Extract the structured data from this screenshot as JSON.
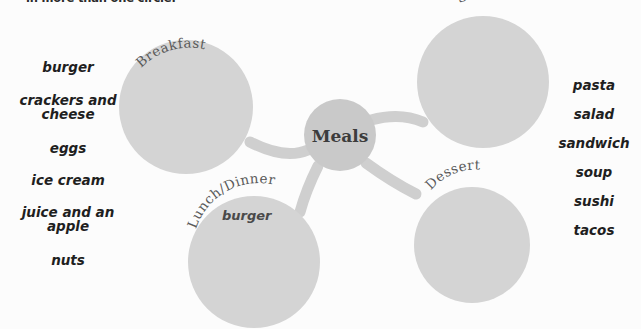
{
  "instruction": "in more than one circle.",
  "colors": {
    "background": "#fcfcfc",
    "circle_fill": "#d4d4d4",
    "center_fill": "#c9c9c9",
    "connector": "#cfcfcf",
    "label_text": "#5a5a5a",
    "word_text": "#1f1f1f"
  },
  "center_node": {
    "label": "Meals"
  },
  "nodes": [
    {
      "id": "breakfast",
      "label": "Breakfast",
      "dropped_words": []
    },
    {
      "id": "snack",
      "label": "Snack",
      "dropped_words": []
    },
    {
      "id": "lunch-dinner",
      "label": "Lunch/Dinner",
      "dropped_words": [
        "burger"
      ]
    },
    {
      "id": "dessert",
      "label": "Dessert",
      "dropped_words": []
    }
  ],
  "word_bank_left": [
    "burger",
    "crackers and\ncheese",
    "eggs",
    "ice cream",
    "juice and an\napple",
    "nuts"
  ],
  "word_bank_right": [
    "pasta",
    "salad",
    "sandwich",
    "soup",
    "sushi",
    "tacos"
  ]
}
